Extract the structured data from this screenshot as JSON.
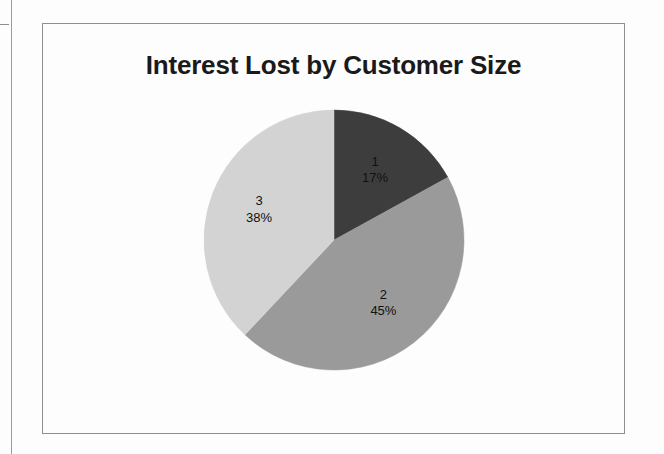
{
  "document": {
    "background_color": "#fdfdfd",
    "frame_border_color": "#8f8f8f",
    "scan_line_color": "#9a9a9a"
  },
  "chart_data": {
    "type": "pie",
    "title": "Interest Lost by Customer Size",
    "xlabel": "",
    "ylabel": "",
    "legend_position": "none",
    "labels_inside_slices": true,
    "start_angle_deg": 0,
    "direction": "clockwise",
    "categories": [
      "1",
      "2",
      "3"
    ],
    "values": [
      17,
      45,
      38
    ],
    "value_labels": [
      "17%",
      "45%",
      "38%"
    ],
    "colors": [
      "#3d3d3d",
      "#9a9a9a",
      "#d3d3d3"
    ],
    "slices": [
      {
        "category": "1",
        "percent": 17,
        "percent_label": "17%",
        "color": "#3d3d3d"
      },
      {
        "category": "2",
        "percent": 45,
        "percent_label": "45%",
        "color": "#9a9a9a"
      },
      {
        "category": "3",
        "percent": 38,
        "percent_label": "38%",
        "color": "#d3d3d3"
      }
    ]
  }
}
